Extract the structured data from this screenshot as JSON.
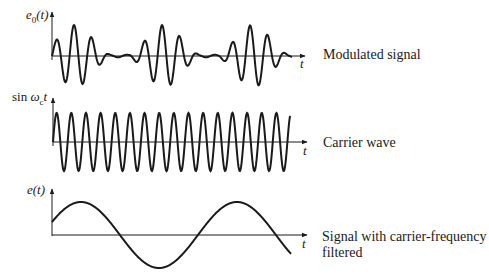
{
  "panels": [
    {
      "id": "modulated",
      "ylabel_main": "e",
      "ylabel_sub": "0",
      "ylabel_tail": "(t)",
      "xlabel": "t",
      "caption": "Modulated signal"
    },
    {
      "id": "carrier",
      "ylabel_prefix": "sin ",
      "ylabel_main": "ω",
      "ylabel_sub": "c",
      "ylabel_tail": "t",
      "xlabel": "t",
      "caption": "Carrier wave"
    },
    {
      "id": "demodulated",
      "ylabel_main": "e(t)",
      "xlabel": "t",
      "caption_line1": "Signal with carrier-frequency",
      "caption_line2": "filtered"
    }
  ],
  "chart_data": [
    {
      "type": "line",
      "title": "Modulated signal",
      "ylabel": "e0(t)",
      "xlabel": "t",
      "description": "Amplitude-modulated carrier: carrier multiplied by slowly varying envelope with ~2.3 envelope cycles; envelope maxima near x=75,163,252 px, near-nulls near x=115,205 px",
      "carrier_cycles_visible": 14,
      "grid": false
    },
    {
      "type": "line",
      "title": "Carrier wave",
      "ylabel": "sin ωct",
      "xlabel": "t",
      "description": "Constant-amplitude sinusoid starting at zero going up",
      "cycles_visible": 16,
      "grid": false
    },
    {
      "type": "line",
      "title": "Signal with carrier-frequency filtered",
      "ylabel": "e(t)",
      "xlabel": "t",
      "description": "Low-frequency sinusoid recovered after demodulation, starting above zero, about 1.5 cycles",
      "cycles_visible": 1.6,
      "grid": false
    }
  ],
  "colors": {
    "ink": "#1a1a1a",
    "background": "#ffffff"
  }
}
